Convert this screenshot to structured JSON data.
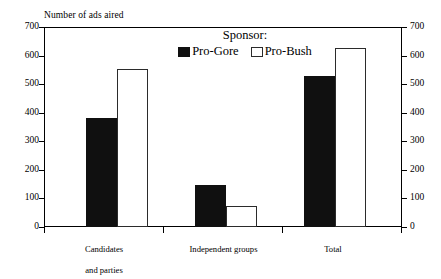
{
  "chart_data": {
    "type": "bar",
    "title": "",
    "ylabel": "Number of ads aired",
    "xlabel": "",
    "ylim": [
      0,
      700
    ],
    "yticks": [
      0,
      100,
      200,
      300,
      400,
      500,
      600,
      700
    ],
    "right_axis": true,
    "right_yticks": [
      0,
      100,
      200,
      300,
      400,
      500,
      600,
      700
    ],
    "grid": false,
    "legend_position": "top-center",
    "legend_title": "Sponsor:",
    "categories": [
      "Candidates\nand parties",
      "Independent groups",
      "Total"
    ],
    "series": [
      {
        "name": "Pro-Gore",
        "color": "#101010",
        "values": [
          383,
          146,
          528
        ]
      },
      {
        "name": "Pro-Bush",
        "color": "#ffffff",
        "values": [
          553,
          75,
          628
        ]
      }
    ]
  },
  "legend": {
    "title": "Sponsor:",
    "entries": [
      {
        "label": "Pro-Gore",
        "swatch": "filled-black-square"
      },
      {
        "label": "Pro-Bush",
        "swatch": "open-white-square"
      }
    ]
  },
  "axes": {
    "y_title": "Number of ads aired",
    "left_ticks": [
      "700",
      "600",
      "500",
      "400",
      "300",
      "200",
      "100",
      "0"
    ],
    "right_ticks": [
      "700",
      "600",
      "500",
      "400",
      "300",
      "200",
      "100",
      "0"
    ]
  },
  "categories": [
    {
      "line1": "Candidates",
      "line2": "and parties"
    },
    {
      "line1": "Independent groups",
      "line2": ""
    },
    {
      "line1": "Total",
      "line2": ""
    }
  ]
}
